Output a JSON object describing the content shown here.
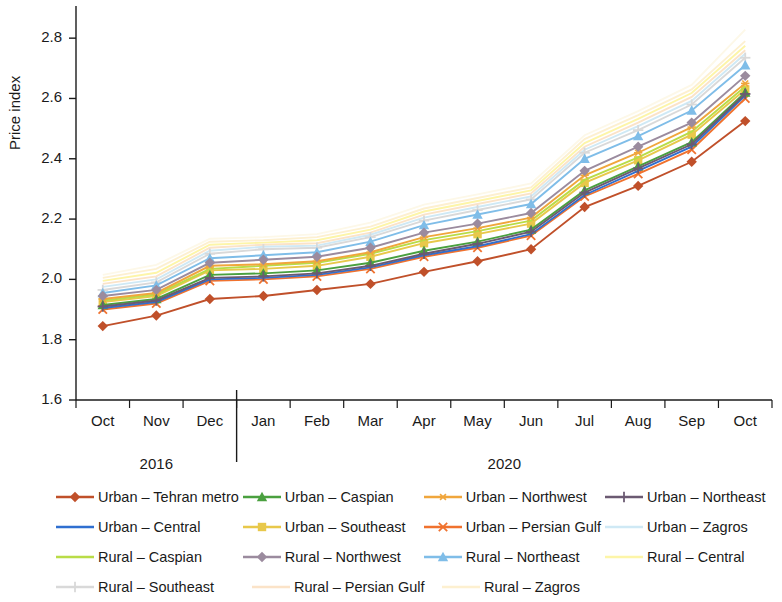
{
  "chart_data": {
    "type": "line",
    "title": "",
    "xlabel": "",
    "ylabel": "Price index",
    "ylim": [
      1.6,
      2.9
    ],
    "yticks": [
      1.6,
      1.8,
      2.0,
      2.2,
      2.4,
      2.6,
      2.8
    ],
    "ytick_labels": [
      "1.6",
      "1.8",
      "2.0",
      "2.2",
      "2.4",
      "2.6",
      "2.8"
    ],
    "grid": false,
    "legend_position": "bottom",
    "categories": [
      "Oct",
      "Nov",
      "Dec",
      "Jan",
      "Feb",
      "Mar",
      "Apr",
      "May",
      "Jun",
      "Jul",
      "Aug",
      "Sep",
      "Oct"
    ],
    "group_labels": [
      {
        "label": "2016",
        "from": "Oct",
        "to": "Dec"
      },
      {
        "label": "2020",
        "from": "Jan",
        "to": "Oct"
      }
    ],
    "series": [
      {
        "name": "Urban – Tehran metro",
        "color": "#c0502a",
        "marker": "diamond",
        "values": [
          1.845,
          1.88,
          1.935,
          1.945,
          1.965,
          1.985,
          2.025,
          2.06,
          2.1,
          2.24,
          2.31,
          2.39,
          2.525
        ]
      },
      {
        "name": "Urban – Central",
        "color": "#2f6fd0",
        "marker": "line",
        "values": [
          1.905,
          1.925,
          2.0,
          2.005,
          2.015,
          2.04,
          2.08,
          2.11,
          2.15,
          2.28,
          2.36,
          2.44,
          2.61
        ]
      },
      {
        "name": "Rural – Caspian",
        "color": "#b9dc47",
        "marker": "line",
        "values": [
          1.93,
          1.95,
          2.035,
          2.045,
          2.055,
          2.085,
          2.13,
          2.16,
          2.195,
          2.33,
          2.405,
          2.49,
          2.64
        ]
      },
      {
        "name": "Rural – Southeast",
        "color": "#d9d9d9",
        "marker": "plus",
        "values": [
          1.965,
          1.99,
          2.085,
          2.1,
          2.105,
          2.14,
          2.195,
          2.23,
          2.265,
          2.42,
          2.495,
          2.58,
          2.735
        ]
      },
      {
        "name": "Urban – Caspian",
        "color": "#4aa03f",
        "marker": "triangle",
        "values": [
          1.915,
          1.935,
          2.015,
          2.02,
          2.03,
          2.055,
          2.095,
          2.125,
          2.165,
          2.295,
          2.375,
          2.455,
          2.62
        ]
      },
      {
        "name": "Urban – Southeast",
        "color": "#e8c84a",
        "marker": "square",
        "values": [
          1.925,
          1.945,
          2.03,
          2.035,
          2.045,
          2.075,
          2.12,
          2.15,
          2.185,
          2.32,
          2.395,
          2.48,
          2.63
        ]
      },
      {
        "name": "Rural – Northwest",
        "color": "#9b8b9e",
        "marker": "diamond",
        "values": [
          1.945,
          1.965,
          2.055,
          2.065,
          2.075,
          2.105,
          2.155,
          2.185,
          2.22,
          2.36,
          2.44,
          2.52,
          2.675
        ]
      },
      {
        "name": "Rural – Persian Gulf",
        "color": "#fbe3c8",
        "marker": "line",
        "values": [
          1.985,
          2.01,
          2.105,
          2.115,
          2.12,
          2.155,
          2.215,
          2.25,
          2.285,
          2.44,
          2.52,
          2.605,
          2.76
        ]
      },
      {
        "name": "Urban – Northwest",
        "color": "#f0a63c",
        "marker": "asterisk",
        "values": [
          1.935,
          1.955,
          2.045,
          2.05,
          2.06,
          2.09,
          2.14,
          2.17,
          2.205,
          2.345,
          2.42,
          2.505,
          2.65
        ]
      },
      {
        "name": "Urban – Persian Gulf",
        "color": "#f0722e",
        "marker": "cross",
        "values": [
          1.9,
          1.92,
          1.995,
          2.0,
          2.01,
          2.035,
          2.075,
          2.105,
          2.145,
          2.275,
          2.35,
          2.43,
          2.6
        ]
      },
      {
        "name": "Rural – Northeast",
        "color": "#7fbde8",
        "marker": "triangle",
        "values": [
          1.955,
          1.98,
          2.07,
          2.08,
          2.09,
          2.125,
          2.18,
          2.215,
          2.25,
          2.4,
          2.475,
          2.56,
          2.71
        ]
      },
      {
        "name": "Rural – Zagros",
        "color": "#fdf0d0",
        "marker": "line",
        "values": [
          2.005,
          2.035,
          2.125,
          2.13,
          2.14,
          2.175,
          2.235,
          2.27,
          2.305,
          2.465,
          2.545,
          2.63,
          2.79
        ]
      },
      {
        "name": "Urban – Northeast",
        "color": "#6b5a72",
        "marker": "plus",
        "values": [
          1.91,
          1.93,
          2.005,
          2.01,
          2.02,
          2.045,
          2.085,
          2.118,
          2.158,
          2.288,
          2.368,
          2.448,
          2.615
        ]
      },
      {
        "name": "Urban – Zagros",
        "color": "#cfe9f5",
        "marker": "line",
        "values": [
          1.975,
          2.0,
          2.095,
          2.108,
          2.112,
          2.148,
          2.205,
          2.24,
          2.275,
          2.43,
          2.508,
          2.592,
          2.748
        ]
      },
      {
        "name": "Rural – Central",
        "color": "#fdf5a8",
        "marker": "line",
        "values": [
          1.995,
          2.022,
          2.115,
          2.122,
          2.13,
          2.165,
          2.225,
          2.26,
          2.295,
          2.452,
          2.532,
          2.618,
          2.775
        ]
      },
      {
        "name": "Rural – Tehran metro",
        "color": "#fdf8e8",
        "marker": "line",
        "values": [
          2.015,
          2.048,
          2.135,
          2.14,
          2.15,
          2.188,
          2.248,
          2.282,
          2.318,
          2.478,
          2.558,
          2.645,
          2.828
        ]
      }
    ]
  },
  "legend": {
    "rows": [
      [
        {
          "label": "Urban – Tehran metro",
          "color": "#c0502a",
          "marker": "diamond"
        },
        {
          "label": "Urban – Caspian",
          "color": "#4aa03f",
          "marker": "triangle"
        },
        {
          "label": "Urban – Northwest",
          "color": "#f0a63c",
          "marker": "asterisk"
        },
        {
          "label": "Urban – Northeast",
          "color": "#6b5a72",
          "marker": "plus"
        }
      ],
      [
        {
          "label": "Urban – Central",
          "color": "#2f6fd0",
          "marker": "line"
        },
        {
          "label": "Urban – Southeast",
          "color": "#e8c84a",
          "marker": "square"
        },
        {
          "label": "Urban – Persian Gulf",
          "color": "#f0722e",
          "marker": "cross"
        },
        {
          "label": "Urban – Zagros",
          "color": "#cfe9f5",
          "marker": "line"
        }
      ],
      [
        {
          "label": "Rural – Caspian",
          "color": "#b9dc47",
          "marker": "line"
        },
        {
          "label": "Rural – Northwest",
          "color": "#9b8b9e",
          "marker": "diamond"
        },
        {
          "label": "Rural – Northeast",
          "color": "#7fbde8",
          "marker": "triangle"
        },
        {
          "label": "Rural – Central",
          "color": "#fdf5a8",
          "marker": "line"
        }
      ],
      [
        {
          "label": "Rural – Southeast",
          "color": "#d9d9d9",
          "marker": "plus"
        },
        {
          "label": "Rural – Persian Gulf",
          "color": "#fbe3c8",
          "marker": "line"
        },
        {
          "label": "Rural – Zagros",
          "color": "#fdf0d0",
          "marker": "line"
        }
      ]
    ]
  }
}
